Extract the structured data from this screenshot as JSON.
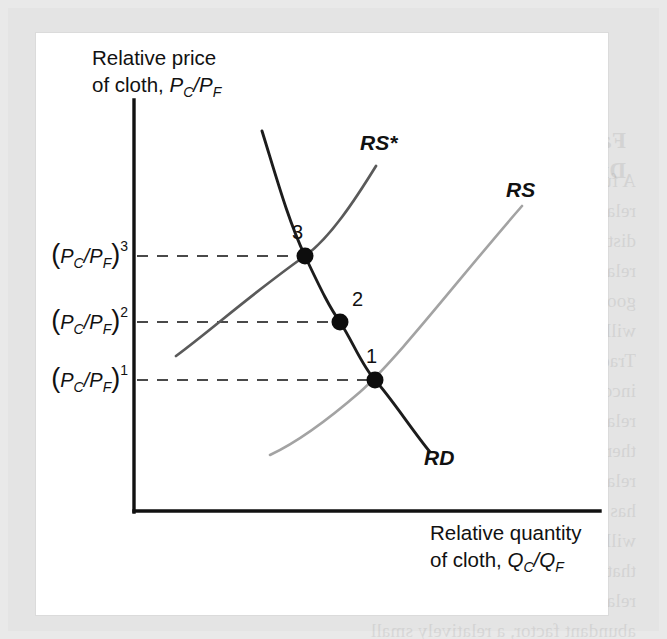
{
  "figure": {
    "type": "economics-diagram",
    "background_color": "#e9e9e9",
    "panel_color": "#ffffff",
    "y_axis_label_line1": "Relative price",
    "y_axis_label_line2_prefix": "of cloth, ",
    "y_axis_label_var_p1": "P",
    "y_axis_label_sub1": "C",
    "y_axis_label_slash": "/",
    "y_axis_label_var_p2": "P",
    "y_axis_label_sub2": "F",
    "x_axis_label_line1": "Relative quantity",
    "x_axis_label_line2_prefix": "of cloth, ",
    "x_axis_label_var_q1": "Q",
    "x_axis_label_sub1": "C",
    "x_axis_label_slash": "/",
    "x_axis_label_var_q2": "Q",
    "x_axis_label_sub2": "F"
  },
  "tick_labels": [
    {
      "id": "tick-3",
      "open": "(",
      "var1": "P",
      "sub1": "C",
      "slash": "/",
      "var2": "P",
      "sub2": "F",
      "close": ")",
      "sup": "3",
      "y": 256
    },
    {
      "id": "tick-2",
      "open": "(",
      "var1": "P",
      "sub1": "C",
      "slash": "/",
      "var2": "P",
      "sub2": "F",
      "close": ")",
      "sup": "2",
      "y": 322
    },
    {
      "id": "tick-1",
      "open": "(",
      "var1": "P",
      "sub1": "C",
      "slash": "/",
      "var2": "P",
      "sub2": "F",
      "close": ")",
      "sup": "1",
      "y": 380
    }
  ],
  "curves": [
    {
      "id": "RD",
      "label": "RD",
      "color": "#1c1c1c",
      "label_x": 424,
      "label_y": 465,
      "description": "relative demand, downward sloping"
    },
    {
      "id": "RS",
      "label": "RS",
      "color": "#a3a3a3",
      "label_x": 506,
      "label_y": 197,
      "description": "relative supply, upward sloping"
    },
    {
      "id": "RSstar",
      "label": "RS*",
      "color": "#5a5a5a",
      "label_x": 360,
      "label_y": 150,
      "description": "shifted relative supply, upward sloping"
    }
  ],
  "equilibria": [
    {
      "id": "point-1",
      "label": "1",
      "x": 375,
      "y": 380,
      "label_x": 366,
      "label_y": 363
    },
    {
      "id": "point-2",
      "label": "2",
      "x": 340,
      "y": 322,
      "label_x": 352,
      "label_y": 306
    },
    {
      "id": "point-3",
      "label": "3",
      "x": 305,
      "y": 256,
      "label_x": 292,
      "label_y": 239
    }
  ],
  "bleed_text": {
    "heading": "Factor Prices and the Distribution of Income",
    "body": "A further important implication of the relative price changes is for the distribution of income. At any given relative price of cloth, in fact if both goods are produced the home country will produce more cloth and less food. Trade has been shown to affect on income distribution. Here, a rise in relative price for our trade model, but there are other derived effects on the relative price of cloth in the country that has abundant supply of the home factor will rise and relative price in the country that has scarce factor will fall. In short a relative rise in the abundant factor is the abundant factor, a relatively small supply of the home factor will rise and relative gain from the increase in the abundant factor."
  }
}
